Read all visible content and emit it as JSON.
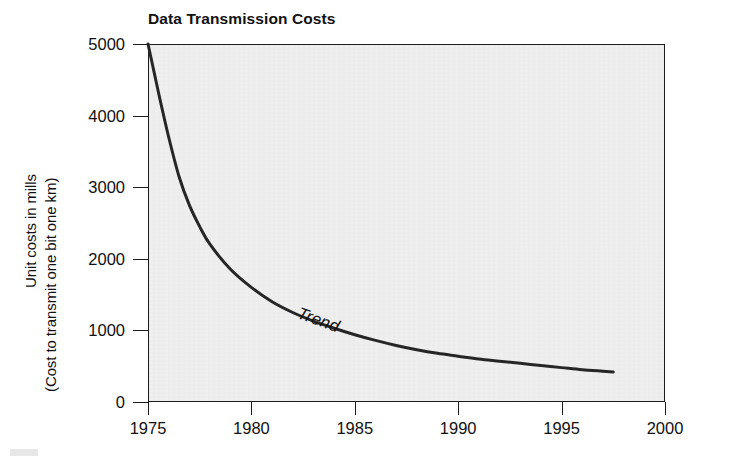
{
  "chart_data": {
    "type": "line",
    "title": "Data Transmission Costs",
    "xlabel": "",
    "ylabel": "Unit costs in mills",
    "ylabel_line1": "Unit costs in mills",
    "ylabel_line2": "(Cost to transmit one bit one km)",
    "xlim": [
      1975,
      2000
    ],
    "ylim": [
      0,
      5000
    ],
    "grid": false,
    "legend": "none",
    "annotations": [
      {
        "text": "Trend",
        "x": 1983,
        "y": 1150,
        "style": "italic",
        "rotation": 20
      }
    ],
    "xticks": [
      1975,
      1980,
      1985,
      1990,
      1995,
      2000
    ],
    "xtick_labels": [
      "1975",
      "1980",
      "1985",
      "1990",
      "1995",
      "2000"
    ],
    "yticks": [
      0,
      1000,
      2000,
      3000,
      4000,
      5000
    ],
    "ytick_labels": [
      "0",
      "1000",
      "2000",
      "3000",
      "4000",
      "5000"
    ],
    "series": [
      {
        "name": "Trend",
        "color": "#262626",
        "linewidth": 3,
        "x": [
          1975.0,
          1975.3,
          1975.6,
          1976.0,
          1976.5,
          1977.0,
          1977.5,
          1978.0,
          1979.0,
          1980.0,
          1981.0,
          1982.0,
          1983.0,
          1984.0,
          1985.0,
          1986.0,
          1987.0,
          1988.0,
          1989.0,
          1990.0,
          1991.0,
          1992.0,
          1993.0,
          1994.0,
          1995.0,
          1996.0,
          1997.0,
          1997.5
        ],
        "y": [
          5000,
          4600,
          4200,
          3700,
          3150,
          2750,
          2450,
          2200,
          1850,
          1600,
          1400,
          1250,
          1130,
          1030,
          940,
          860,
          790,
          730,
          680,
          640,
          600,
          570,
          540,
          510,
          480,
          450,
          430,
          420
        ]
      }
    ]
  },
  "plot": {
    "background_color": "#f0f0f0",
    "frame_color": "#1b1b1b",
    "curve_color": "#262626"
  }
}
